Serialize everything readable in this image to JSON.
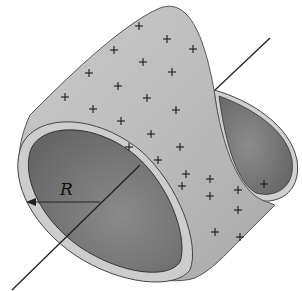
{
  "diagram": {
    "type": "charged-cylindrical-shell",
    "labels": {
      "radius": "R"
    },
    "colors": {
      "outer_surface": "#bdbdbd",
      "inner_surface": "#7a7a7a",
      "rim": "#cfcfcf",
      "edge": "#333333",
      "axis": "#222222",
      "charge": "#1a1a1a"
    },
    "charge_symbol": "+",
    "charges": [
      [
        139,
        26
      ],
      [
        167,
        39
      ],
      [
        193,
        49
      ],
      [
        114,
        50
      ],
      [
        143,
        62
      ],
      [
        172,
        72
      ],
      [
        89,
        73
      ],
      [
        118,
        86
      ],
      [
        147,
        98
      ],
      [
        176,
        110
      ],
      [
        65,
        97
      ],
      [
        93,
        109
      ],
      [
        121,
        121
      ],
      [
        151,
        134
      ],
      [
        180,
        147
      ],
      [
        129,
        147
      ],
      [
        158,
        160
      ],
      [
        186,
        174
      ],
      [
        210,
        179
      ],
      [
        238,
        190
      ],
      [
        182,
        186
      ],
      [
        210,
        196
      ],
      [
        238,
        210
      ],
      [
        264,
        184
      ],
      [
        215,
        232
      ],
      [
        240,
        237
      ]
    ]
  }
}
